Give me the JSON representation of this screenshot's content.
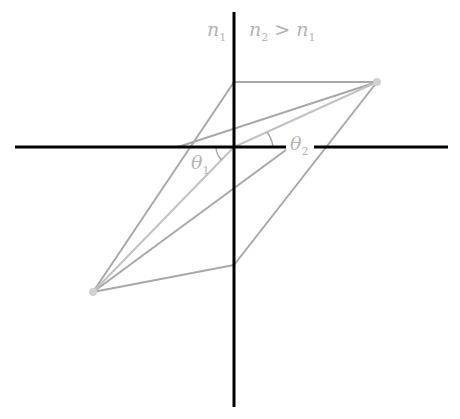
{
  "diagram": {
    "title": "",
    "labels": {
      "medium1": "n",
      "medium1_sub": "1",
      "medium2": "n",
      "medium2_sub": "2",
      "relation": " > ",
      "relation_rhs": "n",
      "relation_rhs_sub": "1",
      "theta1": "θ",
      "theta1_sub": "1",
      "theta2": "θ",
      "theta2_sub": "2"
    },
    "colors": {
      "axis": "#000000",
      "lines": "#a8a8a8",
      "label": "#b4b4b4",
      "dot": "#d0d0d0"
    },
    "geometry": {
      "origin": [
        234,
        147
      ],
      "horizontal_axis": [
        [
          15,
          147
        ],
        [
          448,
          147
        ]
      ],
      "vertical_axis": [
        [
          234,
          12
        ],
        [
          234,
          407
        ]
      ],
      "top_right_dot": [
        377,
        82
      ],
      "bottom_left_dot": [
        93,
        292
      ],
      "top_corner": [
        234,
        82
      ],
      "bottom_corner": [
        234,
        265
      ]
    }
  }
}
